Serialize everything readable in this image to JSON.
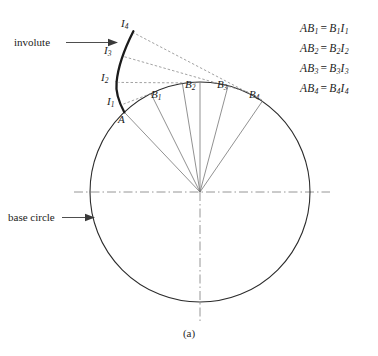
{
  "figure": {
    "caption": "(a)",
    "annotations": {
      "involute_label": "involute",
      "base_circle_label": "base circle"
    },
    "point_labels": {
      "A": "A",
      "B1": "B",
      "B1sub": "1",
      "B2": "B",
      "B2sub": "2",
      "B3": "B",
      "B3sub": "3",
      "B4": "B",
      "B4sub": "4",
      "I1": "I",
      "I1sub": "1",
      "I2": "I",
      "I2sub": "2",
      "I3": "I",
      "I3sub": "3",
      "I4": "I",
      "I4sub": "4"
    },
    "equations": [
      {
        "lhs_letter": "AB",
        "lhs_sub": "1",
        "eq": "=",
        "rhs_b": "B",
        "rhs_b_sub": "1",
        "rhs_i": "I",
        "rhs_i_sub": "1"
      },
      {
        "lhs_letter": "AB",
        "lhs_sub": "2",
        "eq": "=",
        "rhs_b": "B",
        "rhs_b_sub": "2",
        "rhs_i": "I",
        "rhs_i_sub": "2"
      },
      {
        "lhs_letter": "AB",
        "lhs_sub": "3",
        "eq": "=",
        "rhs_b": "B",
        "rhs_b_sub": "3",
        "rhs_i": "I",
        "rhs_i_sub": "3"
      },
      {
        "lhs_letter": "AB",
        "lhs_sub": "4",
        "eq": "=",
        "rhs_b": "B",
        "rhs_b_sub": "4",
        "rhs_i": "I",
        "rhs_i_sub": "4"
      }
    ],
    "colors": {
      "stroke": "#2b2b2b",
      "thin_stroke": "#6e6e6e",
      "dashed_stroke": "#8c8c8c",
      "centerline": "#8a8a8a",
      "background": "#ffffff"
    },
    "geometry": {
      "circle_center_x": 200,
      "circle_center_y": 192,
      "circle_radius": 110
    }
  }
}
